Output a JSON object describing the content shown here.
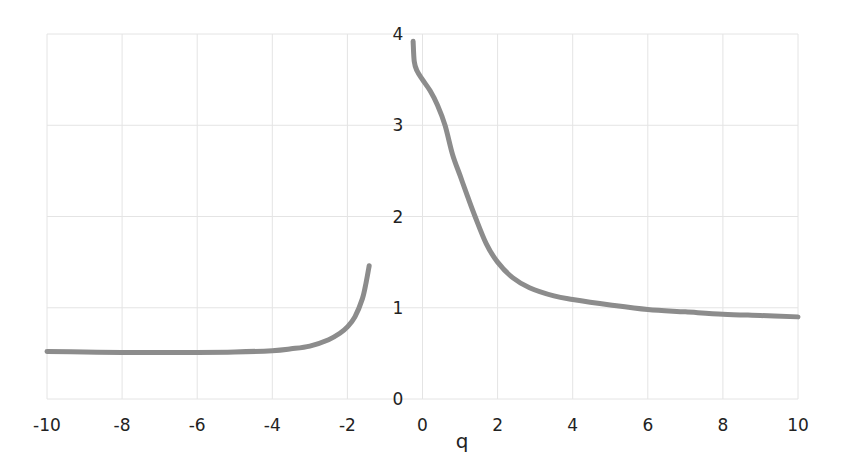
{
  "chart_data": {
    "type": "line",
    "title": "",
    "xlabel": "q",
    "ylabel": "",
    "xlim": [
      -10,
      10
    ],
    "ylim": [
      0,
      4
    ],
    "x_ticks": [
      "-10",
      "-8",
      "-6",
      "-4",
      "-2",
      "0",
      "2",
      "4",
      "6",
      "8",
      "10"
    ],
    "y_ticks": [
      "0",
      "1",
      "2",
      "3",
      "4"
    ],
    "grid": true,
    "legend": null,
    "line_color": "#8c8c8c",
    "series": [
      {
        "name": "branch-left",
        "x": [
          -10,
          -9,
          -8,
          -7,
          -6,
          -5,
          -4,
          -3.5,
          -3,
          -2.5,
          -2.2,
          -2,
          -1.8,
          -1.6,
          -1.5,
          -1.42
        ],
        "y": [
          0.52,
          0.515,
          0.51,
          0.51,
          0.51,
          0.515,
          0.53,
          0.55,
          0.58,
          0.65,
          0.72,
          0.79,
          0.9,
          1.1,
          1.28,
          1.46
        ]
      },
      {
        "name": "branch-right",
        "x": [
          -0.25,
          -0.22,
          -0.15,
          0,
          0.2,
          0.4,
          0.6,
          0.8,
          1.0,
          1.2,
          1.4,
          1.7,
          2.0,
          2.4,
          2.85,
          3.5,
          4,
          5,
          6,
          7,
          8,
          9,
          10
        ],
        "y": [
          3.92,
          3.7,
          3.6,
          3.5,
          3.38,
          3.22,
          3.0,
          2.68,
          2.45,
          2.22,
          2.0,
          1.7,
          1.5,
          1.33,
          1.22,
          1.13,
          1.09,
          1.03,
          0.98,
          0.955,
          0.93,
          0.915,
          0.9
        ]
      }
    ]
  }
}
